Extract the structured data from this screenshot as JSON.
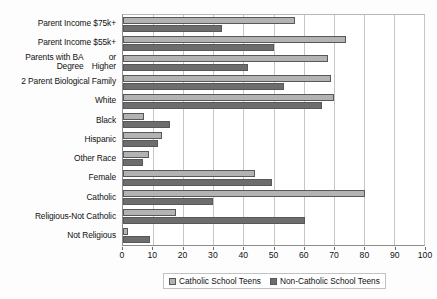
{
  "chart_data": {
    "type": "bar",
    "orientation": "horizontal",
    "title": "",
    "xlabel": "",
    "ylabel": "",
    "xlim": [
      0,
      100
    ],
    "xticks": [
      0,
      10,
      20,
      30,
      40,
      50,
      60,
      70,
      80,
      90,
      100
    ],
    "grid": true,
    "legend_position": "bottom",
    "categories": [
      "Parent Income $75k+",
      "Parent Income $55k+",
      "Parents with BA Degree or Higher",
      "2 Parent Biological Family",
      "White",
      "Black",
      "Hispanic",
      "Other Race",
      "Female",
      "Catholic",
      "Religious-Not Catholic",
      "Not Religious"
    ],
    "category_lines": [
      [
        "Parent Income $75k+"
      ],
      [
        "Parent Income $55k+"
      ],
      [
        "Parents with BA Degree",
        "or Higher"
      ],
      [
        "2 Parent Biological Family"
      ],
      [
        "White"
      ],
      [
        "Black"
      ],
      [
        "Hispanic"
      ],
      [
        "Other Race"
      ],
      [
        "Female"
      ],
      [
        "Catholic"
      ],
      [
        "Religious-Not Catholic"
      ],
      [
        "Not Religious"
      ]
    ],
    "series": [
      {
        "name": "Catholic School Teens",
        "color": "#b3b3b3",
        "values": [
          57,
          74,
          68,
          69,
          70,
          7,
          13,
          8.5,
          44,
          80.5,
          17.5,
          1.5
        ]
      },
      {
        "name": "Non-Catholic School Teens",
        "color": "#6d6d6d",
        "values": [
          33,
          50,
          41.5,
          53.5,
          66,
          15.5,
          11.5,
          6.5,
          49.5,
          30,
          60.5,
          9
        ]
      }
    ]
  },
  "legend": {
    "items": [
      {
        "label": "Catholic School Teens"
      },
      {
        "label": "Non-Catholic School Teens"
      }
    ]
  },
  "colors": {
    "series_0": "#b3b3b3",
    "series_1": "#6d6d6d",
    "gridline": "#c6c6c6",
    "axis": "#8c8c8c",
    "text": "#111111",
    "background": "#ffffff"
  }
}
